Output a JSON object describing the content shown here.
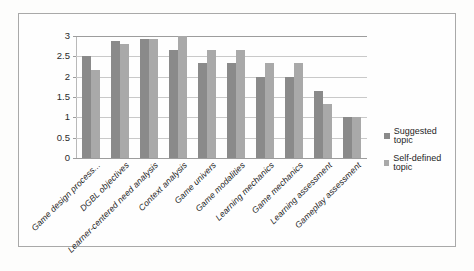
{
  "chart_data": {
    "type": "bar",
    "title": "",
    "xlabel": "",
    "ylabel": "",
    "ylim": [
      0,
      3
    ],
    "ytick_labels": [
      "3",
      "2.5",
      "2",
      "1.5",
      "1",
      "0.5",
      "0"
    ],
    "ytick_values": [
      3,
      2.5,
      2,
      1.5,
      1,
      0.5,
      0
    ],
    "grid": true,
    "legend_position": "right",
    "categories": [
      "Game design process...",
      "DGBL objectives",
      "Learner-centered need analysis",
      "Context analysis",
      "Game univers",
      "Game modalities",
      "Learning mechanics",
      "Game mechanics",
      "Learning assessment",
      "Gameplay assessment"
    ],
    "series": [
      {
        "name": "Suggested topic",
        "color": "#8a8a8a",
        "values": [
          2.5,
          2.87,
          2.93,
          2.65,
          2.33,
          2.33,
          2.0,
          2.0,
          1.66,
          1.0
        ]
      },
      {
        "name": "Self-defined topic",
        "color": "#a9a9a9",
        "values": [
          2.16,
          2.8,
          2.93,
          3.0,
          2.65,
          2.65,
          2.33,
          2.33,
          1.33,
          1.0
        ]
      }
    ]
  },
  "legend": {
    "items": [
      {
        "label": "Suggested topic"
      },
      {
        "label": "Self-defined topic"
      }
    ]
  }
}
